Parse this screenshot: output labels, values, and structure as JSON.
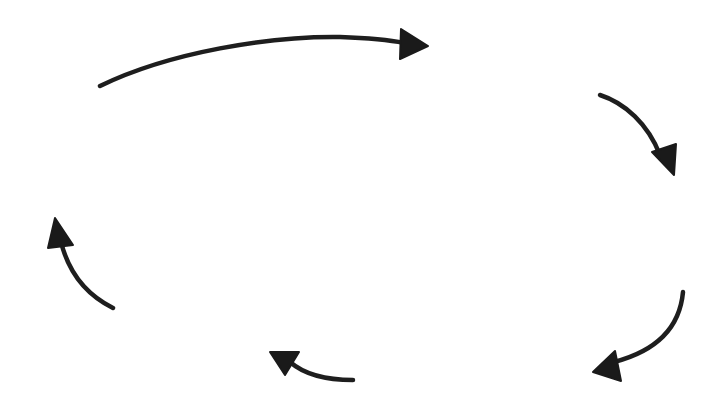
{
  "diagram": {
    "type": "cycle",
    "direction": "clockwise",
    "colors": {
      "background": "#ffffff",
      "arrow": "#1e1e1e"
    },
    "arrows": [
      {
        "id": "top",
        "from": [
          100,
          86
        ],
        "to": [
          428,
          47
        ],
        "position": "top-left to top-right"
      },
      {
        "id": "right-upper",
        "from": [
          600,
          95
        ],
        "to": [
          675,
          175
        ],
        "position": "right upper"
      },
      {
        "id": "right-lower",
        "from": [
          683,
          292
        ],
        "to": [
          593,
          372
        ],
        "position": "right lower"
      },
      {
        "id": "bottom",
        "from": [
          353,
          380
        ],
        "to": [
          270,
          352
        ],
        "position": "bottom middle"
      },
      {
        "id": "left",
        "from": [
          113,
          308
        ],
        "to": [
          55,
          218
        ],
        "position": "left"
      }
    ]
  }
}
